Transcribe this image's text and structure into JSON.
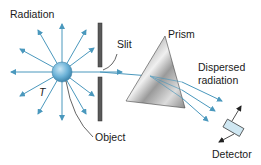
{
  "diagram": {
    "labels": {
      "radiation": "Radiation",
      "slit": "Slit",
      "prism": "Prism",
      "dispersed_line1": "Dispersed",
      "dispersed_line2": "radiation",
      "object": "Object",
      "temperature": "T",
      "detector": "Detector"
    },
    "colors": {
      "ray": "#4a98bd",
      "sphere": "#6db3d8",
      "slit": "#555555",
      "prism_dark": "#6a6a6a",
      "prism_light": "#e6e6e6",
      "text": "#1a1a1a"
    },
    "icons": {
      "object": "sphere",
      "slit": "vertical-bars",
      "prism": "triangle",
      "detector": "rotated-rectangle"
    }
  }
}
